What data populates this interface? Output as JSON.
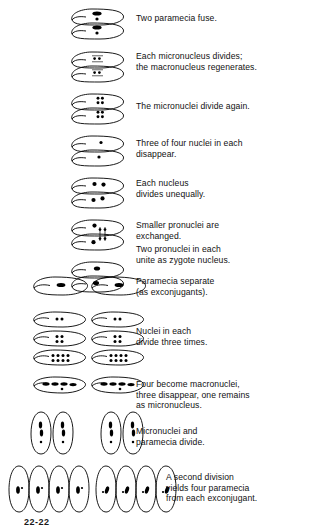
{
  "figure": {
    "page_number": "22-22",
    "line_color": "#000000",
    "nucleus_color": "#000000",
    "background": "#ffffff"
  },
  "stages": [
    {
      "id": "fusion",
      "caption": "Two paramecia fuse.",
      "caption_lines": [
        "Two paramecia fuse."
      ],
      "cell_count": 2,
      "arrangement": "conjugating-pair-horizontal",
      "nuclei_description": "one macronucleus and one micronucleus per cell"
    },
    {
      "id": "micronucleus-divides",
      "caption": "Each micronucleus divides;\nthe macronucleus regenerates.",
      "caption_lines": [
        "Each micronucleus divides;",
        "the macronucleus regenerates."
      ],
      "cell_count": 2,
      "arrangement": "conjugating-pair-horizontal",
      "nuclei_description": "two micronuclei, degenerating macronucleus"
    },
    {
      "id": "micronuclei-divide-again",
      "caption": "The micronuclei divide again.",
      "caption_lines": [
        "The micronuclei divide again."
      ],
      "cell_count": 2,
      "arrangement": "conjugating-pair-horizontal",
      "nuclei_description": "four micronuclei in a 2 by 2 grid per cell"
    },
    {
      "id": "three-of-four-disappear",
      "caption": "Three of four nuclei in each\ndisappear.",
      "caption_lines": [
        "Three of four nuclei in each",
        "disappear."
      ],
      "cell_count": 2,
      "arrangement": "conjugating-pair-horizontal",
      "nuclei_description": "single remaining micronucleus per cell"
    },
    {
      "id": "nucleus-divides-unequally",
      "caption": "Each nucleus\ndivides unequally.",
      "caption_lines": [
        "Each nucleus",
        "divides unequally."
      ],
      "cell_count": 2,
      "arrangement": "conjugating-pair-horizontal",
      "nuclei_description": "a large and a small pronucleus per cell"
    },
    {
      "id": "pronuclei-exchanged",
      "caption": "Smaller pronuclei are\nexchanged.",
      "caption_lines": [
        "Smaller pronuclei are",
        "exchanged."
      ],
      "cell_count": 2,
      "arrangement": "conjugating-pair-horizontal",
      "nuclei_description": "small pronuclei crossing the cytoplasmic bridge"
    },
    {
      "id": "zygote-nucleus",
      "caption": "Two pronuclei in each\nunite as zygote nucleus.",
      "caption_lines": [
        "Two pronuclei in each",
        "unite as zygote nucleus."
      ],
      "cell_count": 2,
      "arrangement": "conjugating-pair-horizontal",
      "nuclei_description": "fused zygote nucleus per cell"
    },
    {
      "id": "paramecia-separate",
      "caption": "Paramecia separate\n(as exconjugants).",
      "caption_lines": [
        "Paramecia separate",
        "(as exconjugants)."
      ],
      "cell_count": 2,
      "arrangement": "two-separate-cells",
      "nuclei_description": "one zygote nucleus per cell"
    },
    {
      "id": "nuclei-divide-three-times",
      "caption": "Nuclei in each\ndivide three times.",
      "caption_lines": [
        "Nuclei in each",
        "divide three times."
      ],
      "cell_count": 6,
      "arrangement": "three-rows-of-two",
      "nuclei_counts": [
        2,
        4,
        8
      ],
      "nuclei_description": "nuclei double from two to four to eight"
    },
    {
      "id": "four-become-macronuclei",
      "caption": "Four become macronuclei,\nthree disappear, one remains\nas micronucleus.",
      "caption_lines": [
        "Four become macronuclei,",
        "three disappear, one remains",
        "as micronucleus."
      ],
      "cell_count": 2,
      "arrangement": "two-separate-cells",
      "nuclei_description": "four elongated macronuclei plus one micronucleus"
    },
    {
      "id": "micronuclei-and-paramecia-divide",
      "caption": "Micronuclei and\nparamecia divide.",
      "caption_lines": [
        "Micronuclei and",
        "paramecia divide."
      ],
      "cell_count": 4,
      "arrangement": "two-pairs-vertical",
      "nuclei_description": "two macronuclei and one micronucleus per daughter cell"
    },
    {
      "id": "second-division",
      "caption": "A second division\nyields four paramecia\nfrom each exconjugant.",
      "caption_lines": [
        "A second division",
        "yields four paramecia",
        "from each exconjugant."
      ],
      "cell_count": 8,
      "arrangement": "two-groups-of-four-vertical",
      "nuclei_description": "one macronucleus and one micronucleus per cell"
    }
  ]
}
